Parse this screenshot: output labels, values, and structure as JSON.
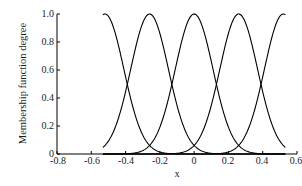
{
  "figure": {
    "background_color": "#ffffff",
    "line_color": "#000000",
    "axis_color": "#000000"
  },
  "chart_data": {
    "type": "line",
    "title": "",
    "subtitle": "",
    "xlabel": "x",
    "ylabel": "Membership function degree",
    "xlim": [
      -0.8,
      0.6
    ],
    "ylim": [
      0.0,
      1.0
    ],
    "grid": false,
    "legend": false,
    "legend_position": "none",
    "xticks": [
      -0.8,
      -0.6,
      -0.4,
      -0.2,
      0,
      0.2,
      0.4,
      0.6
    ],
    "xticklabels": [
      "-0.8",
      "-0.6",
      "-0.4",
      "-0.2",
      "0",
      "0.2",
      "0.4",
      "0.6"
    ],
    "yticks": [
      0,
      0.2,
      0.4,
      0.6,
      0.8,
      1.0
    ],
    "yticklabels": [
      "0",
      "0.2",
      "0.4",
      "0.6",
      "0.8",
      "1.0"
    ],
    "curve_shape": "gaussian",
    "curve_sigma": 0.11,
    "crossing_degree": 0.37,
    "x_domain_drawn": [
      -0.53,
      0.53
    ],
    "series": [
      {
        "name": "MF1",
        "center": -0.52,
        "sigma": 0.11,
        "peak_value": 1.0,
        "x": [
          -0.53,
          -0.52,
          -0.46,
          -0.41,
          -0.39,
          -0.35,
          -0.3,
          -0.25,
          -0.2,
          -0.15,
          -0.1
        ],
        "values": [
          1.0,
          1.0,
          0.86,
          0.6,
          0.49,
          0.29,
          0.12,
          0.03,
          0.01,
          0.0,
          0.0
        ]
      },
      {
        "name": "MF2",
        "center": -0.26,
        "sigma": 0.11,
        "peak_value": 1.0,
        "x": [
          -0.53,
          -0.48,
          -0.43,
          -0.39,
          -0.35,
          -0.31,
          -0.26,
          -0.21,
          -0.17,
          -0.13,
          -0.08,
          -0.03,
          0.02
        ],
        "values": [
          0.02,
          0.06,
          0.17,
          0.37,
          0.61,
          0.84,
          1.0,
          0.84,
          0.61,
          0.37,
          0.12,
          0.02,
          0.0
        ]
      },
      {
        "name": "MF3",
        "center": 0.0,
        "sigma": 0.11,
        "peak_value": 1.0,
        "x": [
          -0.3,
          -0.26,
          -0.22,
          -0.17,
          -0.13,
          -0.09,
          -0.04,
          0.0,
          0.04,
          0.09,
          0.13,
          0.17,
          0.22,
          0.26,
          0.3
        ],
        "values": [
          0.03,
          0.06,
          0.17,
          0.37,
          0.61,
          0.84,
          0.97,
          1.0,
          0.97,
          0.84,
          0.61,
          0.37,
          0.17,
          0.06,
          0.03
        ]
      },
      {
        "name": "MF4",
        "center": 0.26,
        "sigma": 0.11,
        "peak_value": 1.0,
        "x": [
          -0.02,
          0.03,
          0.08,
          0.13,
          0.17,
          0.21,
          0.26,
          0.31,
          0.35,
          0.39,
          0.43,
          0.48,
          0.53
        ],
        "values": [
          0.0,
          0.02,
          0.12,
          0.37,
          0.61,
          0.84,
          1.0,
          0.84,
          0.61,
          0.37,
          0.17,
          0.06,
          0.02
        ]
      },
      {
        "name": "MF5",
        "center": 0.52,
        "sigma": 0.11,
        "peak_value": 1.0,
        "x": [
          0.1,
          0.15,
          0.2,
          0.25,
          0.3,
          0.35,
          0.39,
          0.41,
          0.46,
          0.52,
          0.53
        ],
        "values": [
          0.0,
          0.0,
          0.01,
          0.03,
          0.12,
          0.29,
          0.49,
          0.6,
          0.86,
          1.0,
          1.0
        ]
      }
    ]
  }
}
